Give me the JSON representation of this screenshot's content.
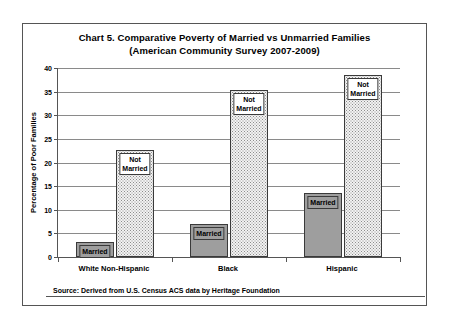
{
  "chart_data": {
    "type": "bar",
    "title": "Chart 5. Comparative Poverty of Married vs Unmarried Families",
    "subtitle": "(American Community Survey 2007-2009)",
    "xlabel": "",
    "ylabel": "Percentage of Poor Families",
    "ylim": [
      0,
      40
    ],
    "ytick_step": 5,
    "yticks": [
      "0",
      "5",
      "10",
      "15",
      "20",
      "25",
      "30",
      "35",
      "40"
    ],
    "grid": true,
    "legend_position": "in-bar-labels",
    "categories": [
      "White Non-Hispanic",
      "Black",
      "Hispanic"
    ],
    "series": [
      {
        "name": "Married",
        "values": [
          3.2,
          7.0,
          13.5
        ]
      },
      {
        "name": "Not Married",
        "values": [
          22.6,
          35.3,
          38.5
        ]
      }
    ],
    "bar_labels": {
      "married": "Married",
      "not_married_line1": "Not",
      "not_married_line2": "Married"
    },
    "source": "Source: Derived from U.S. Census ACS data by Heritage Foundation",
    "colors": {
      "married_fill": "#9e9e9e",
      "not_married_fill": "#f2f2f2",
      "bar_border": "#3a3a3a",
      "gridline": "#8a8a8a",
      "axis": "#555555",
      "background": "#ffffff",
      "text": "#000000"
    }
  }
}
